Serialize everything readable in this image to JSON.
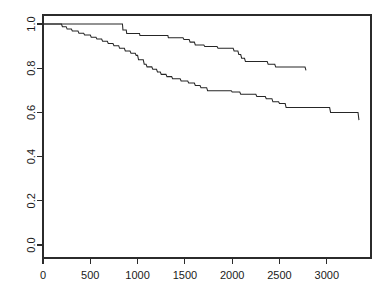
{
  "figure": {
    "background_color": "#ffffff",
    "line_color": "#262626",
    "axis_color": "#2b2b2b",
    "width_px": 389,
    "height_px": 303
  },
  "chart_data": {
    "type": "line",
    "subtype": "kaplan-meier-step",
    "title": "",
    "subtitle": "",
    "xlabel": "",
    "ylabel": "",
    "xlim": [
      0,
      3470
    ],
    "ylim": [
      0.0,
      1.04
    ],
    "grid": false,
    "legend_position": "none",
    "x_ticks": [
      0,
      500,
      1000,
      1500,
      2000,
      2500,
      3000
    ],
    "x_tick_labels": [
      "0",
      "500",
      "1000",
      "1500",
      "2000",
      "2500",
      "3000"
    ],
    "y_ticks": [
      0.0,
      0.2,
      0.4,
      0.6,
      0.8,
      1.0
    ],
    "y_tick_labels": [
      "0.0",
      "0.2",
      "0.4",
      "0.6",
      "0.8",
      "1.0"
    ],
    "annotations": [],
    "series": [
      {
        "name": "upper-curve",
        "final_value": 0.79,
        "final_x": 2780,
        "points": [
          [
            0,
            1.0
          ],
          [
            840,
            1.0
          ],
          [
            845,
            0.973
          ],
          [
            880,
            0.973
          ],
          [
            885,
            0.957
          ],
          [
            1020,
            0.957
          ],
          [
            1025,
            0.948
          ],
          [
            1320,
            0.948
          ],
          [
            1325,
            0.938
          ],
          [
            1480,
            0.938
          ],
          [
            1490,
            0.93
          ],
          [
            1545,
            0.93
          ],
          [
            1555,
            0.918
          ],
          [
            1600,
            0.918
          ],
          [
            1610,
            0.905
          ],
          [
            1700,
            0.905
          ],
          [
            1710,
            0.898
          ],
          [
            1840,
            0.898
          ],
          [
            1850,
            0.89
          ],
          [
            2010,
            0.89
          ],
          [
            2020,
            0.878
          ],
          [
            2060,
            0.878
          ],
          [
            2070,
            0.862
          ],
          [
            2090,
            0.862
          ],
          [
            2100,
            0.845
          ],
          [
            2130,
            0.845
          ],
          [
            2140,
            0.83
          ],
          [
            2370,
            0.83
          ],
          [
            2380,
            0.818
          ],
          [
            2450,
            0.818
          ],
          [
            2460,
            0.805
          ],
          [
            2770,
            0.805
          ],
          [
            2780,
            0.79
          ]
        ]
      },
      {
        "name": "lower-curve",
        "final_value": 0.565,
        "final_x": 3340,
        "points": [
          [
            0,
            1.0
          ],
          [
            195,
            1.0
          ],
          [
            205,
            0.988
          ],
          [
            245,
            0.988
          ],
          [
            255,
            0.977
          ],
          [
            300,
            0.977
          ],
          [
            310,
            0.968
          ],
          [
            370,
            0.968
          ],
          [
            380,
            0.958
          ],
          [
            430,
            0.958
          ],
          [
            440,
            0.95
          ],
          [
            500,
            0.95
          ],
          [
            510,
            0.94
          ],
          [
            560,
            0.94
          ],
          [
            570,
            0.932
          ],
          [
            620,
            0.932
          ],
          [
            630,
            0.922
          ],
          [
            680,
            0.922
          ],
          [
            690,
            0.912
          ],
          [
            740,
            0.912
          ],
          [
            750,
            0.902
          ],
          [
            800,
            0.902
          ],
          [
            810,
            0.89
          ],
          [
            860,
            0.89
          ],
          [
            870,
            0.878
          ],
          [
            920,
            0.878
          ],
          [
            930,
            0.868
          ],
          [
            975,
            0.868
          ],
          [
            985,
            0.858
          ],
          [
            1000,
            0.858
          ],
          [
            1010,
            0.838
          ],
          [
            1060,
            0.838
          ],
          [
            1070,
            0.818
          ],
          [
            1090,
            0.818
          ],
          [
            1100,
            0.806
          ],
          [
            1150,
            0.806
          ],
          [
            1160,
            0.795
          ],
          [
            1200,
            0.795
          ],
          [
            1210,
            0.783
          ],
          [
            1240,
            0.783
          ],
          [
            1250,
            0.772
          ],
          [
            1300,
            0.772
          ],
          [
            1310,
            0.762
          ],
          [
            1360,
            0.762
          ],
          [
            1370,
            0.752
          ],
          [
            1450,
            0.752
          ],
          [
            1460,
            0.742
          ],
          [
            1530,
            0.742
          ],
          [
            1540,
            0.733
          ],
          [
            1600,
            0.733
          ],
          [
            1610,
            0.722
          ],
          [
            1660,
            0.722
          ],
          [
            1670,
            0.712
          ],
          [
            1730,
            0.712
          ],
          [
            1740,
            0.698
          ],
          [
            1990,
            0.698
          ],
          [
            2000,
            0.692
          ],
          [
            2080,
            0.692
          ],
          [
            2090,
            0.682
          ],
          [
            2250,
            0.682
          ],
          [
            2260,
            0.672
          ],
          [
            2350,
            0.672
          ],
          [
            2360,
            0.662
          ],
          [
            2420,
            0.662
          ],
          [
            2430,
            0.648
          ],
          [
            2490,
            0.648
          ],
          [
            2500,
            0.64
          ],
          [
            2560,
            0.64
          ],
          [
            2570,
            0.622
          ],
          [
            3030,
            0.622
          ],
          [
            3040,
            0.6
          ],
          [
            3330,
            0.6
          ],
          [
            3340,
            0.565
          ]
        ]
      }
    ]
  }
}
